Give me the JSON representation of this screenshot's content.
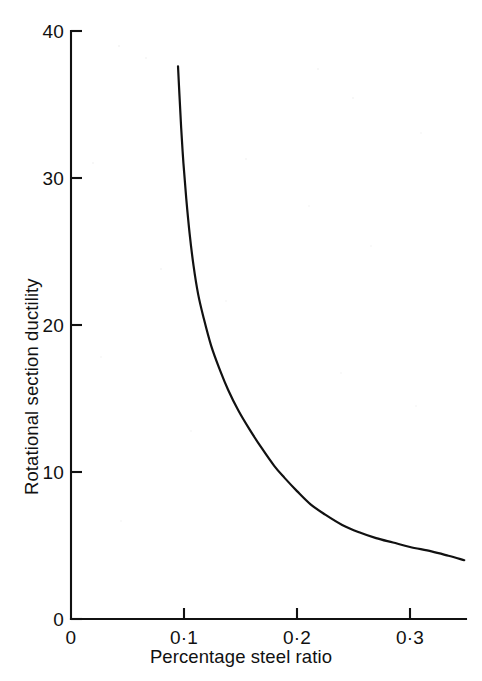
{
  "chart_data": {
    "type": "line",
    "title": "",
    "xlabel": "Percentage steel ratio",
    "ylabel": "Rotational section ductility",
    "xlim": [
      0,
      0.349
    ],
    "ylim": [
      0,
      40
    ],
    "grid": false,
    "legend": null,
    "x_ticks": [
      {
        "value": 0,
        "label": "0"
      },
      {
        "value": 0.1,
        "label": "0·1"
      },
      {
        "value": 0.2,
        "label": "0·2"
      },
      {
        "value": 0.3,
        "label": "0·3"
      }
    ],
    "y_ticks": [
      {
        "value": 0,
        "label": "0"
      },
      {
        "value": 10,
        "label": "10"
      },
      {
        "value": 20,
        "label": "20"
      },
      {
        "value": 30,
        "label": "30"
      },
      {
        "value": 40,
        "label": "40"
      }
    ],
    "series": [
      {
        "name": "Rotational section ductility vs percentage steel ratio",
        "color": "#111111",
        "x": [
          0.0947,
          0.096,
          0.0975,
          0.0995,
          0.102,
          0.105,
          0.1085,
          0.1125,
          0.117,
          0.124,
          0.132,
          0.139,
          0.148,
          0.158,
          0.169,
          0.18,
          0.189,
          0.2,
          0.212,
          0.225,
          0.24,
          0.255,
          0.27,
          0.285,
          0.3,
          0.319,
          0.334,
          0.348
        ],
        "y": [
          37.6,
          35.6,
          33.4,
          31.0,
          28.6,
          26.2,
          24.0,
          22.1,
          20.6,
          18.6,
          16.9,
          15.6,
          14.2,
          12.9,
          11.6,
          10.4,
          9.6,
          8.7,
          7.8,
          7.1,
          6.4,
          5.9,
          5.5,
          5.2,
          4.9,
          4.6,
          4.3,
          4.0
        ]
      }
    ]
  },
  "axes": {
    "x_axis_name": "percentage-steel-ratio-axis",
    "y_axis_name": "rotational-section-ductility-axis"
  }
}
